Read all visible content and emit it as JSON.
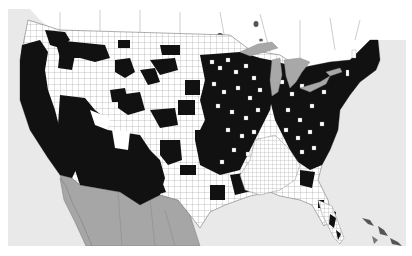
{
  "map": {
    "type": "choropleth",
    "region": "Contiguous United States (county level)",
    "categories": [
      {
        "name": "highlighted",
        "color": "#111111"
      },
      {
        "name": "not-highlighted",
        "color": "#ffffff"
      }
    ],
    "colors": {
      "ocean": "#e9e9e9",
      "great_lakes": "#a8a8a8",
      "mexico": "#a6a6a6",
      "canada": "#ffffff",
      "county_border": "#777777",
      "highlighted": "#111111",
      "not_highlighted": "#ffffff"
    }
  }
}
